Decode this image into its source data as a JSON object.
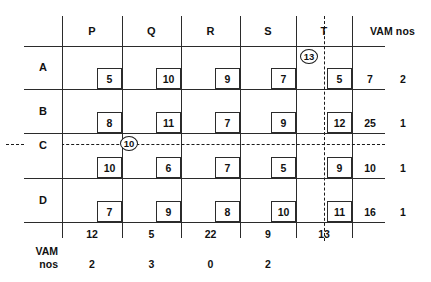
{
  "table": {
    "column_header_label": "VAM nos",
    "row_footer_label_line1": "VAM",
    "row_footer_label_line2": "nos",
    "columns": [
      "P",
      "Q",
      "R",
      "S",
      "T"
    ],
    "rows": [
      "A",
      "B",
      "C",
      "D"
    ],
    "costs": [
      [
        "5",
        "10",
        "9",
        "7",
        "5"
      ],
      [
        "8",
        "11",
        "7",
        "9",
        "12"
      ],
      [
        "10",
        "6",
        "7",
        "5",
        "9"
      ],
      [
        "7",
        "9",
        "8",
        "10",
        "11"
      ]
    ],
    "row_supply": [
      "7",
      "25",
      "10",
      "16"
    ],
    "row_vam": [
      "2",
      "1",
      "1",
      "1"
    ],
    "col_demand": [
      "12",
      "5",
      "22",
      "9",
      "13"
    ],
    "col_vam": [
      "2",
      "3",
      "0",
      "2",
      ""
    ],
    "allocations": [
      {
        "row": "A",
        "col": "T",
        "value": "13"
      },
      {
        "row": "C",
        "col": "Q",
        "value": "10"
      }
    ]
  }
}
